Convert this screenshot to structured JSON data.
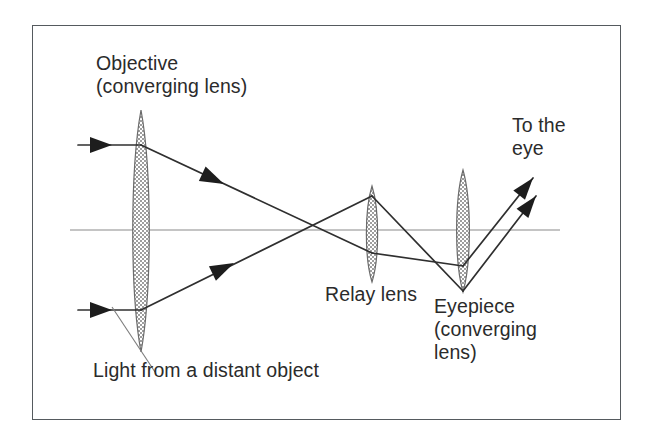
{
  "figure": {
    "name": "telescope-relay-optical-diagram",
    "border_color": "#555a5e",
    "background": "#ffffff"
  },
  "labels": {
    "objective": "Objective\n(converging lens)",
    "relay": "Relay lens",
    "eyepiece": "Eyepiece\n(converging\nlens)",
    "to_eye": "To the\neye",
    "light_source": "Light from a distant object"
  },
  "colors": {
    "ink": "#2b2b2b",
    "ray": "#2f2f2f",
    "axis": "#8a8a8a",
    "lens_outline": "#6b6b6b",
    "lens_fill": "#b3b3b3",
    "frame": "#555a5e"
  },
  "optics": {
    "axis_y": 230,
    "lenses": [
      {
        "name": "objective",
        "cx": 141,
        "top": 110,
        "bottom": 352,
        "half_width": 11
      },
      {
        "name": "relay",
        "cx": 372,
        "top": 186,
        "bottom": 282,
        "half_width": 7.5
      },
      {
        "name": "eyepiece",
        "cx": 463,
        "top": 170,
        "bottom": 292,
        "half_width": 8.5
      }
    ],
    "rays": [
      {
        "name": "upper-incoming",
        "points": "78,145 141,145"
      },
      {
        "name": "lower-incoming",
        "points": "78,310 141,310"
      },
      {
        "name": "upper-after-objective",
        "points": "141,145 372,253"
      },
      {
        "name": "lower-after-objective",
        "points": "141,310 372,196"
      },
      {
        "name": "upper-after-relay",
        "points": "372,253 463,266"
      },
      {
        "name": "lower-after-relay",
        "points": "372,196 463,291"
      },
      {
        "name": "upper-exit-to-eye",
        "points": "463,266 533,178"
      },
      {
        "name": "lower-exit-to-eye",
        "points": "463,291 536,196"
      }
    ],
    "arrowheads": [
      {
        "name": "arrow-upper-incoming",
        "x": 112,
        "y": 145,
        "angle": 0
      },
      {
        "name": "arrow-lower-incoming",
        "x": 112,
        "y": 310,
        "angle": 0
      },
      {
        "name": "arrow-upper-mid",
        "x": 222,
        "y": 183,
        "angle": 25
      },
      {
        "name": "arrow-lower-mid",
        "x": 232,
        "y": 265,
        "angle": -26
      },
      {
        "name": "arrow-exit-upper",
        "x": 530,
        "y": 182,
        "angle": -51
      },
      {
        "name": "arrow-exit-lower",
        "x": 532,
        "y": 200,
        "angle": -52
      }
    ],
    "leader_line": {
      "name": "light-source-leader",
      "points": "155,372 112,307"
    }
  }
}
